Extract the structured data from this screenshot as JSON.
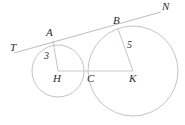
{
  "figure": {
    "type": "geometry-diagram",
    "background_color": "#ffffff",
    "stroke_color": "#b9b9bd",
    "label_color": "#2b2b2b",
    "canvas": {
      "width": 185,
      "height": 125
    }
  },
  "circles": [
    {
      "name": "small-circle",
      "center_label": "H",
      "center": {
        "x": 58,
        "y": 71
      },
      "radius": 26,
      "radius_label": "3"
    },
    {
      "name": "large-circle",
      "center_label": "K",
      "center": {
        "x": 133,
        "y": 71
      },
      "radius": 45,
      "radius_label": "5"
    }
  ],
  "segments": [
    {
      "name": "tangent-line-TN",
      "from_label": "T",
      "to_label": "N",
      "x1": 14,
      "y1": 53,
      "x2": 161,
      "y2": 12
    },
    {
      "name": "center-line-HK",
      "from_label": "H",
      "to_label": "K",
      "x1": 58,
      "y1": 71,
      "x2": 133,
      "y2": 71
    },
    {
      "name": "radius-HA",
      "from_label": "H",
      "to_label": "A",
      "x1": 58,
      "y1": 71,
      "x2": 53,
      "y2": 41
    },
    {
      "name": "radius-KB",
      "from_label": "K",
      "to_label": "B",
      "x1": 133,
      "y1": 71,
      "x2": 118,
      "y2": 29
    }
  ],
  "labels": [
    {
      "name": "label-T",
      "text": "T",
      "x": 10,
      "y": 42,
      "kind": "point"
    },
    {
      "name": "label-A",
      "text": "A",
      "x": 46,
      "y": 27,
      "kind": "point"
    },
    {
      "name": "label-B",
      "text": "B",
      "x": 113,
      "y": 15,
      "kind": "point"
    },
    {
      "name": "label-N",
      "text": "N",
      "x": 162,
      "y": 1,
      "kind": "point"
    },
    {
      "name": "label-H",
      "text": "H",
      "x": 53,
      "y": 73,
      "kind": "point"
    },
    {
      "name": "label-C",
      "text": "C",
      "x": 87,
      "y": 73,
      "kind": "point"
    },
    {
      "name": "label-K",
      "text": "K",
      "x": 129,
      "y": 73,
      "kind": "point"
    },
    {
      "name": "label-3",
      "text": "3",
      "x": 44,
      "y": 51,
      "kind": "measure"
    },
    {
      "name": "label-5",
      "text": "5",
      "x": 127,
      "y": 40,
      "kind": "measure"
    }
  ],
  "tangency_points": [
    {
      "name": "tangency-point-A",
      "label": "A",
      "x": 53,
      "y": 41
    },
    {
      "name": "tangency-point-B",
      "label": "B",
      "x": 118,
      "y": 29
    },
    {
      "name": "tangency-point-C",
      "label": "C",
      "x": 88,
      "y": 71
    }
  ]
}
